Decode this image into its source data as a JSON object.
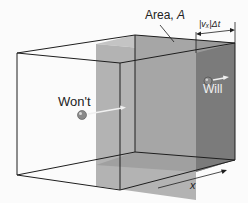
{
  "figure": {
    "area_label": "Area, ",
    "area_symbol": "A",
    "displacement_label": "|vₓ|Δt",
    "particle_wont_label": "Won't",
    "particle_will_label": "Will",
    "axis_label": "x"
  },
  "colors": {
    "box_edge": "#1e1e1e",
    "slab_light": "#b3b3b3",
    "slab_mid": "#9f9f9f",
    "slab_dark": "#7b7b7b",
    "particle": "#8a8a8a",
    "arrow": "#f0f0f0"
  }
}
